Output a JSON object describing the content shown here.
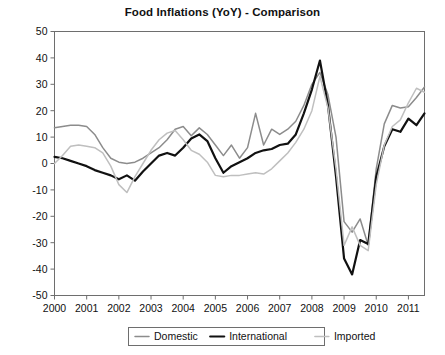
{
  "chart_data": {
    "type": "line",
    "title": "Food Inflations (YoY) - Comparison",
    "xlabel": "",
    "ylabel": "",
    "xlim": [
      2000,
      2011.5
    ],
    "ylim": [
      -50,
      50
    ],
    "yticks": [
      -50,
      -40,
      -30,
      -20,
      -10,
      0,
      10,
      20,
      30,
      40,
      50
    ],
    "ytick_labels": [
      "-50",
      "-40",
      "-30",
      "-20",
      "-10",
      "0",
      "10",
      "20",
      "30",
      "40",
      "50"
    ],
    "xticks": [
      2000,
      2001,
      2002,
      2003,
      2004,
      2005,
      2006,
      2007,
      2008,
      2009,
      2010,
      2011
    ],
    "xtick_labels": [
      "2000",
      "2001",
      "2002",
      "2003",
      "2004",
      "2005",
      "2006",
      "2007",
      "2008",
      "2009",
      "2010",
      "2011"
    ],
    "grid": false,
    "legend_position": "bottom-center",
    "series": [
      {
        "name": "Domestic",
        "color": "#8c8c8c",
        "width": 1.5,
        "x": [
          2000.0,
          2000.25,
          2000.5,
          2000.75,
          2001.0,
          2001.25,
          2001.5,
          2001.75,
          2002.0,
          2002.25,
          2002.5,
          2002.75,
          2003.0,
          2003.25,
          2003.5,
          2003.75,
          2004.0,
          2004.25,
          2004.5,
          2004.75,
          2005.0,
          2005.25,
          2005.5,
          2005.75,
          2006.0,
          2006.25,
          2006.5,
          2006.75,
          2007.0,
          2007.25,
          2007.5,
          2007.75,
          2008.0,
          2008.25,
          2008.5,
          2008.75,
          2009.0,
          2009.25,
          2009.5,
          2009.75,
          2010.0,
          2010.25,
          2010.5,
          2010.75,
          2011.0,
          2011.25,
          2011.5
        ],
        "values": [
          13.5,
          14.0,
          14.5,
          14.5,
          14.0,
          11.0,
          6.0,
          2.0,
          0.5,
          0.0,
          0.5,
          2.0,
          4.0,
          6.0,
          9.0,
          13.0,
          14.0,
          10.5,
          13.5,
          11.0,
          7.0,
          3.0,
          7.0,
          2.0,
          6.0,
          19.0,
          7.0,
          13.0,
          11.0,
          13.0,
          16.0,
          22.0,
          30.0,
          34.5,
          26.0,
          10.0,
          -22.0,
          -26.0,
          -21.0,
          -31.0,
          -2.0,
          15.0,
          22.0,
          21.0,
          21.5,
          25.0,
          29.0
        ]
      },
      {
        "name": "International",
        "color": "#111111",
        "width": 2.2,
        "x": [
          2000.0,
          2000.25,
          2000.5,
          2000.75,
          2001.0,
          2001.25,
          2001.5,
          2001.75,
          2002.0,
          2002.25,
          2002.5,
          2002.75,
          2003.0,
          2003.25,
          2003.5,
          2003.75,
          2004.0,
          2004.25,
          2004.5,
          2004.75,
          2005.0,
          2005.25,
          2005.5,
          2005.75,
          2006.0,
          2006.25,
          2006.5,
          2006.75,
          2007.0,
          2007.25,
          2007.5,
          2007.75,
          2008.0,
          2008.25,
          2008.5,
          2008.75,
          2009.0,
          2009.25,
          2009.5,
          2009.75,
          2010.0,
          2010.25,
          2010.5,
          2010.75,
          2011.0,
          2011.25,
          2011.5
        ],
        "values": [
          2.5,
          2.0,
          1.0,
          0.0,
          -1.0,
          -2.5,
          -3.5,
          -4.5,
          -6.0,
          -4.5,
          -6.5,
          -3.0,
          0.0,
          3.0,
          4.0,
          3.0,
          6.0,
          9.5,
          11.0,
          8.5,
          2.0,
          -3.5,
          -1.0,
          0.5,
          2.0,
          4.0,
          5.0,
          5.5,
          7.0,
          7.5,
          11.0,
          19.0,
          28.0,
          39.0,
          22.0,
          -5.0,
          -36.0,
          -42.0,
          -29.0,
          -30.5,
          -5.0,
          6.5,
          13.0,
          12.0,
          17.0,
          14.5,
          19.0
        ]
      },
      {
        "name": "Imported",
        "color": "#bfbfbf",
        "width": 1.5,
        "x": [
          2000.0,
          2000.25,
          2000.5,
          2000.75,
          2001.0,
          2001.25,
          2001.5,
          2001.75,
          2002.0,
          2002.25,
          2002.5,
          2002.75,
          2003.0,
          2003.25,
          2003.5,
          2003.75,
          2004.0,
          2004.25,
          2004.5,
          2004.75,
          2005.0,
          2005.25,
          2005.5,
          2005.75,
          2006.0,
          2006.25,
          2006.5,
          2006.75,
          2007.0,
          2007.25,
          2007.5,
          2007.75,
          2008.0,
          2008.25,
          2008.5,
          2008.75,
          2009.0,
          2009.25,
          2009.5,
          2009.75,
          2010.0,
          2010.25,
          2010.5,
          2010.75,
          2011.0,
          2011.25,
          2011.5
        ],
        "values": [
          0.0,
          3.0,
          6.5,
          7.0,
          6.5,
          6.0,
          4.0,
          -1.0,
          -8.0,
          -11.0,
          -5.0,
          0.0,
          5.0,
          9.0,
          11.5,
          12.5,
          9.0,
          5.0,
          3.5,
          0.5,
          -4.5,
          -5.0,
          -4.5,
          -4.5,
          -4.0,
          -3.5,
          -4.0,
          -2.0,
          1.0,
          4.0,
          8.0,
          13.0,
          20.0,
          33.0,
          21.0,
          -2.0,
          -31.0,
          -24.0,
          -31.0,
          -33.0,
          -8.0,
          7.0,
          14.0,
          16.5,
          23.0,
          28.5,
          27.0
        ]
      }
    ]
  },
  "legend": {
    "items": [
      {
        "label": "Domestic"
      },
      {
        "label": "International"
      },
      {
        "label": "Imported"
      }
    ]
  }
}
